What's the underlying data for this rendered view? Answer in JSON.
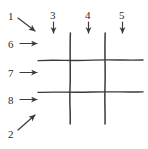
{
  "figure": {
    "name": "hand-drawn-grid-annotation-diagram",
    "background_color": "#ffffff",
    "ink_color": "#333333",
    "label_color": "#2b2b2b",
    "width": 148,
    "height": 149
  },
  "grid": {
    "description": "hand-drawn tic-tac-toe / hash grid of two vertical and two horizontal strokes",
    "stroke_color": "#3a3a3a",
    "vertical_lines": [
      {
        "name": "vertical-line-left",
        "x": 70,
        "y_start": 33,
        "y_end": 124
      },
      {
        "name": "vertical-line-right",
        "x": 105,
        "y_start": 33,
        "y_end": 124
      }
    ],
    "horizontal_lines": [
      {
        "name": "horizontal-line-top",
        "y": 60,
        "x_start": 38,
        "x_end": 143
      },
      {
        "name": "horizontal-line-bottom",
        "y": 92,
        "x_start": 38,
        "x_end": 143
      }
    ]
  },
  "annotations": [
    {
      "id": "1",
      "label": "1",
      "arrow": "diagonal-down-right-arrow",
      "label_x": 8,
      "label_y": 11
    },
    {
      "id": "3",
      "label": "3",
      "arrow": "down-arrow",
      "label_x": 50,
      "label_y": 10
    },
    {
      "id": "4",
      "label": "4",
      "arrow": "down-arrow",
      "label_x": 85,
      "label_y": 10
    },
    {
      "id": "5",
      "label": "5",
      "arrow": "down-arrow",
      "label_x": 119,
      "label_y": 10
    },
    {
      "id": "6",
      "label": "6",
      "arrow": "right-arrow",
      "label_x": 8,
      "label_y": 39
    },
    {
      "id": "7",
      "label": "7",
      "arrow": "right-arrow",
      "label_x": 8,
      "label_y": 68
    },
    {
      "id": "8",
      "label": "8",
      "arrow": "right-arrow",
      "label_x": 8,
      "label_y": 95
    },
    {
      "id": "2",
      "label": "2",
      "arrow": "diagonal-up-right-arrow",
      "label_x": 8,
      "label_y": 129
    }
  ]
}
